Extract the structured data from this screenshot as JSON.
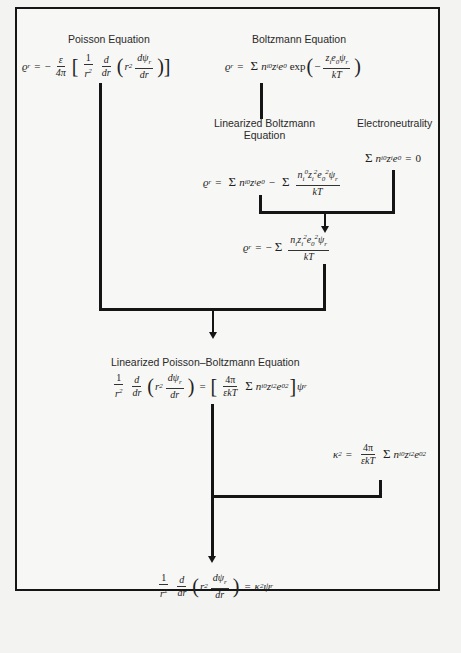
{
  "diagram": {
    "nodes": {
      "poisson": {
        "label": "Poisson Equation",
        "equation_lhs": "ϱr = −",
        "frac_num": "ε",
        "frac_den": "4π",
        "inner": "1/r² · d/dr (r² dψr/dr)"
      },
      "boltzmann": {
        "label": "Boltzmann Equation",
        "equation": "ϱr = Σ ni⁰zie0 exp(− zie0ψr / kT)"
      },
      "linearized_boltzmann": {
        "label_line1": "Linearized  Boltzmann",
        "label_line2": "Equation",
        "equation": "ϱr = Σ ni⁰zie0 − Σ ni⁰zi²e0²ψr / kT"
      },
      "electroneutrality": {
        "label": "Electroneutrality",
        "equation": "Σ ni⁰zie0 = 0"
      },
      "reduced_charge": {
        "equation": "ϱr = − Σ nizi²e0²ψr / kT"
      },
      "linearized_pb": {
        "label": "Linearized  Poisson–Boltzmann  Equation",
        "equation": "1/r² d/dr (r² dψr/dr) = [4π/εkT Σ ni⁰zi²e0²] ψr"
      },
      "kappa": {
        "equation": "κ² = 4π/εkT Σ ni⁰zi²e0²"
      },
      "final": {
        "equation": "1/r² d/dr (r² dψr/dr) = κ²ψr"
      }
    },
    "text": {
      "rho_r": "ϱ",
      "r_sub": "r",
      "eq": "=",
      "minus": "−",
      "eps": "ε",
      "four_pi": "4π",
      "one": "1",
      "r2": "r",
      "two": "2",
      "d": "d",
      "dr": "dr",
      "dpsi": "dψ",
      "psi": "ψ",
      "sum": "Σ",
      "n": "n",
      "i": "i",
      "zero_sup": "0",
      "z": "z",
      "e": "e",
      "zero_sub": "0",
      "exp": "exp",
      "kT": "kT",
      "epskT": "εkT",
      "kappa": "κ",
      "zero": "0"
    },
    "colors": {
      "line": "#151515",
      "background": "#f7f7f5",
      "text": "#222222"
    }
  }
}
